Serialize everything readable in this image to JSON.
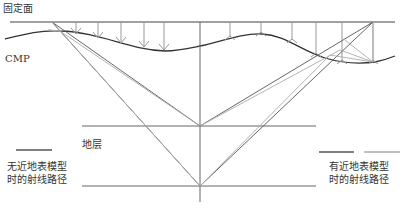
{
  "labels": {
    "datum": "固定面",
    "cmp": "CMP",
    "layer": "地层",
    "legend_left_line1": "无近地表模型",
    "legend_left_line2": "时的射线路径",
    "legend_right_line1": "有近地表模型",
    "legend_right_line2": "时的射线路径"
  },
  "colors": {
    "ray_without_model": "#555555",
    "ray_with_model": "#aaaaaa",
    "surface": "#333333",
    "lines": "#555555"
  }
}
